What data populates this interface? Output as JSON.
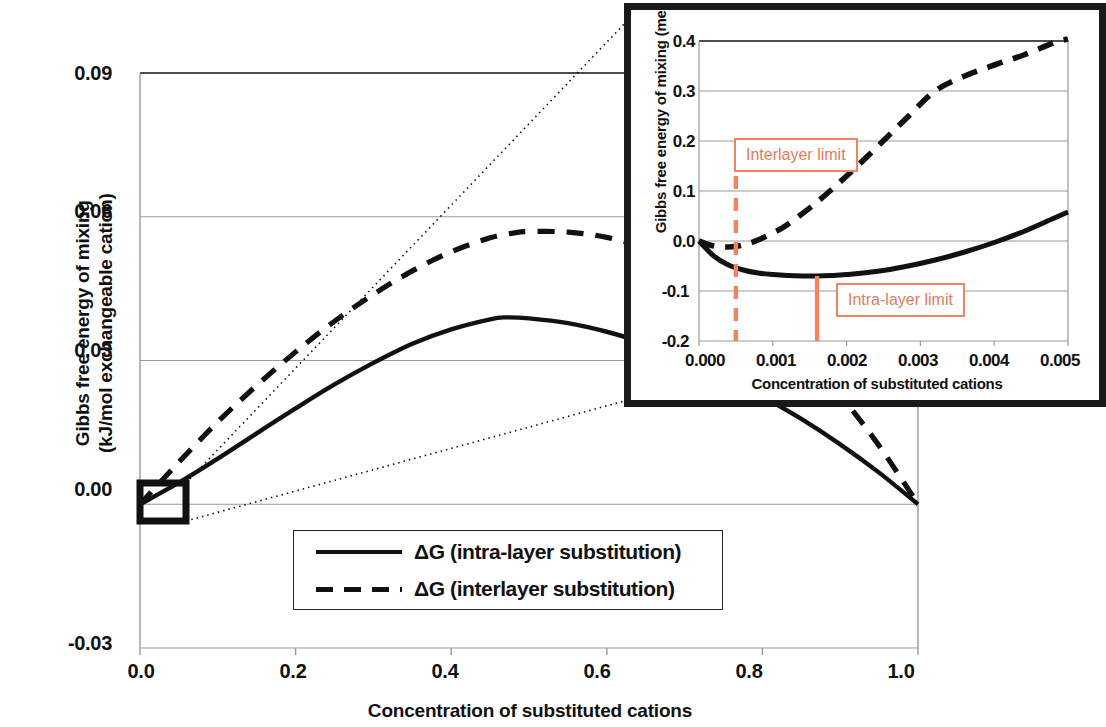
{
  "chart_data": {
    "type": "line",
    "title": "",
    "xlabel": "Concentration of substituted cations",
    "ylabel": "Gibbs free energy of mixing (kJ/mol exchangeable cation)",
    "xlim": [
      0.0,
      1.0
    ],
    "ylim": [
      -0.03,
      0.09
    ],
    "xticks": [
      "0.0",
      "0.2",
      "0.4",
      "0.6",
      "0.8",
      "1.0"
    ],
    "yticks": [
      "0.09",
      "0.06",
      "0.03",
      "0.00",
      "-0.03"
    ],
    "grid": true,
    "legend_position": "lower-center",
    "series": [
      {
        "name": "ΔG (intra-layer substitution)",
        "style": "solid",
        "x": [
          0.0,
          0.05,
          0.1,
          0.15,
          0.2,
          0.25,
          0.3,
          0.35,
          0.4,
          0.45,
          0.47,
          0.5,
          0.55,
          0.6,
          0.65,
          0.7,
          0.75,
          0.8,
          0.85,
          0.9,
          0.95,
          1.0
        ],
        "values": [
          0.0,
          0.0045,
          0.0095,
          0.0148,
          0.02,
          0.025,
          0.0295,
          0.0335,
          0.0365,
          0.0386,
          0.039,
          0.0388,
          0.0378,
          0.036,
          0.0335,
          0.0304,
          0.0268,
          0.0225,
          0.0178,
          0.0125,
          0.0066,
          0.0
        ]
      },
      {
        "name": "ΔG (interlayer substitution)",
        "style": "dashed",
        "x": [
          0.0,
          0.05,
          0.1,
          0.15,
          0.2,
          0.25,
          0.3,
          0.35,
          0.4,
          0.45,
          0.48,
          0.5,
          0.55,
          0.6,
          0.65,
          0.7,
          0.75,
          0.8,
          0.85,
          0.9,
          0.95,
          1.0
        ],
        "values": [
          0.0,
          0.0088,
          0.0172,
          0.0248,
          0.0318,
          0.0382,
          0.0438,
          0.0487,
          0.0527,
          0.0556,
          0.0566,
          0.0569,
          0.0568,
          0.0557,
          0.0535,
          0.05,
          0.0452,
          0.039,
          0.0315,
          0.0227,
          0.0122,
          0.0
        ]
      }
    ],
    "zoom_box": {
      "x_center": 0.0,
      "y_center": 0.0,
      "label": "inset-source-region"
    },
    "inset": {
      "xlabel": "Concentration of substituted cations",
      "ylabel": "Gibbs free energy of mixing (meV)",
      "xlim": [
        0.0,
        0.005
      ],
      "ylim": [
        -0.2,
        0.4
      ],
      "xticks": [
        "0.000",
        "0.001",
        "0.002",
        "0.003",
        "0.004",
        "0.005"
      ],
      "yticks": [
        "0.4",
        "0.3",
        "0.2",
        "0.1",
        "0.0",
        "-0.1",
        "-0.2"
      ],
      "grid": true,
      "series": [
        {
          "name": "ΔG (intra-layer substitution)",
          "style": "solid",
          "x": [
            0.0,
            0.0002,
            0.0004,
            0.0006,
            0.0008,
            0.001,
            0.0012,
            0.0014,
            0.0016,
            0.0018,
            0.002,
            0.0024,
            0.0028,
            0.0032,
            0.0036,
            0.004,
            0.0044,
            0.0048,
            0.005
          ],
          "values": [
            0.0,
            -0.03,
            -0.048,
            -0.058,
            -0.064,
            -0.067,
            -0.069,
            -0.07,
            -0.07,
            -0.069,
            -0.067,
            -0.061,
            -0.051,
            -0.038,
            -0.022,
            -0.003,
            0.019,
            0.045,
            0.058
          ]
        },
        {
          "name": "ΔG (interlayer substitution)",
          "style": "dashed",
          "x": [
            0.0,
            0.0002,
            0.0004,
            0.0006,
            0.0008,
            0.001,
            0.0012,
            0.0016,
            0.002,
            0.0024,
            0.0028,
            0.0032,
            0.0036,
            0.004,
            0.0044,
            0.0048,
            0.005
          ],
          "values": [
            0.0,
            -0.01,
            -0.012,
            -0.008,
            0.002,
            0.016,
            0.033,
            0.078,
            0.13,
            0.186,
            0.244,
            0.3,
            0.33,
            0.352,
            0.372,
            0.396,
            0.404
          ]
        }
      ],
      "annotations": [
        {
          "name": "interlayer-limit",
          "label": "Interlayer limit",
          "x": 0.0005,
          "line_style": "dashed",
          "color": "#F28362"
        },
        {
          "name": "intra-layer-limit",
          "label": "Intra-layer limit",
          "x": 0.0016,
          "line_style": "solid",
          "color": "#F28362"
        }
      ]
    }
  },
  "main": {
    "ylabel_line1": "Gibbs free energy of mixing",
    "ylabel_line2": "(kJ/mol exchangeable cation)",
    "xlabel": "Concentration of substituted cations",
    "yticks": [
      "0.09",
      "0.06",
      "0.03",
      "0.00",
      "-0.03"
    ],
    "xticks": [
      "0.0",
      "0.2",
      "0.4",
      "0.6",
      "0.8",
      "1.0"
    ]
  },
  "legend": {
    "items": [
      {
        "label": "ΔG (intra-layer substitution)",
        "style": "solid"
      },
      {
        "label": "ΔG (interlayer substitution)",
        "style": "dashed"
      }
    ]
  },
  "inset_text": {
    "ylabel": "Gibbs free energy of mixing (meV)",
    "xlabel": "Concentration of substituted cations",
    "yticks": [
      "0.4",
      "0.3",
      "0.2",
      "0.1",
      "0.0",
      "-0.1",
      "-0.2"
    ],
    "xticks": [
      "0.000",
      "0.001",
      "0.002",
      "0.003",
      "0.004",
      "0.005"
    ],
    "interlayer_limit": "Interlayer limit",
    "intralayer_limit": "Intra-layer limit"
  },
  "colors": {
    "ink": "#111111",
    "grid": "#9a9a9a",
    "annotation": "#F28362"
  }
}
